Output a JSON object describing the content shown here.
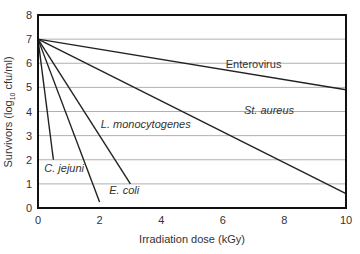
{
  "chart_data": {
    "type": "line",
    "title": "",
    "xlabel": "Irradiation dose (kGy)",
    "ylabel_main": "Survivors (log",
    "ylabel_sub": "10",
    "ylabel_tail": " cfu/ml)",
    "xlim": [
      0,
      10
    ],
    "ylim": [
      0,
      8
    ],
    "xticks": [
      0,
      2,
      4,
      6,
      8,
      10
    ],
    "yticks": [
      0,
      1,
      2,
      3,
      4,
      5,
      6,
      7,
      8
    ],
    "grid": "horizontal",
    "legend": "inline labels",
    "series": [
      {
        "name": "Enterovirus",
        "italic": false,
        "x": [
          0,
          10
        ],
        "y": [
          7,
          4.9
        ],
        "label_pos": [
          7.0,
          5.8
        ]
      },
      {
        "name": "St. aureus",
        "italic": true,
        "x": [
          0,
          10
        ],
        "y": [
          7,
          0.6
        ],
        "label_pos": [
          7.5,
          3.9
        ]
      },
      {
        "name": "L. monocytogenes",
        "italic": true,
        "x": [
          0,
          3
        ],
        "y": [
          7,
          1
        ],
        "label_pos": [
          3.5,
          3.3
        ]
      },
      {
        "name": "E. coli",
        "italic": true,
        "x": [
          0,
          2
        ],
        "y": [
          7,
          0.25
        ],
        "label_pos": [
          2.8,
          0.6
        ]
      },
      {
        "name": "C. jejuni",
        "italic": true,
        "x": [
          0,
          0.5
        ],
        "y": [
          7,
          2
        ],
        "label_pos": [
          0.85,
          1.5
        ]
      }
    ]
  },
  "colors": {
    "line": "#222222",
    "grid": "#b0b0b0",
    "axis": "#111111",
    "text": "#333333"
  }
}
